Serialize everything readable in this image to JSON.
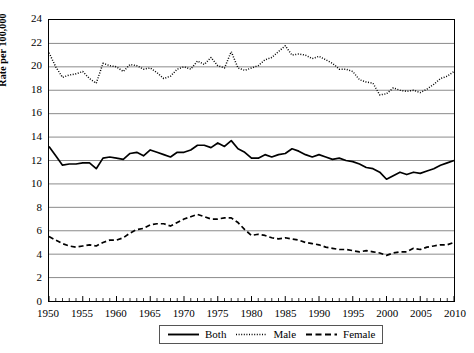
{
  "chart_data": {
    "type": "line",
    "title": "",
    "xlabel": "",
    "ylabel": "Rate per 100,000",
    "xlim": [
      1950,
      2010
    ],
    "ylim": [
      0,
      24
    ],
    "ytick_step": 2,
    "xtick_step": 5,
    "grid": "horizontal",
    "legend_position": "bottom",
    "ytick_labels": [
      "0",
      "2",
      "4",
      "6",
      "8",
      "10",
      "12",
      "14",
      "16",
      "18",
      "20",
      "22",
      "24"
    ],
    "xtick_labels": [
      "1950",
      "1955",
      "1960",
      "1965",
      "1970",
      "1975",
      "1980",
      "1985",
      "1990",
      "1995",
      "2000",
      "2005",
      "2010"
    ],
    "x": [
      1950,
      1951,
      1952,
      1953,
      1954,
      1955,
      1956,
      1957,
      1958,
      1959,
      1960,
      1961,
      1962,
      1963,
      1964,
      1965,
      1966,
      1967,
      1968,
      1969,
      1970,
      1971,
      1972,
      1973,
      1974,
      1975,
      1976,
      1977,
      1978,
      1979,
      1980,
      1981,
      1982,
      1983,
      1984,
      1985,
      1986,
      1987,
      1988,
      1989,
      1990,
      1991,
      1992,
      1993,
      1994,
      1995,
      1996,
      1997,
      1998,
      1999,
      2000,
      2001,
      2002,
      2003,
      2004,
      2005,
      2006,
      2007,
      2008,
      2009,
      2010
    ],
    "series": [
      {
        "name": "Both",
        "style": "solid",
        "color": "#000000",
        "values": [
          13.2,
          12.4,
          11.6,
          11.7,
          11.7,
          11.8,
          11.8,
          11.3,
          12.2,
          12.3,
          12.2,
          12.1,
          12.6,
          12.7,
          12.4,
          12.9,
          12.7,
          12.5,
          12.3,
          12.7,
          12.7,
          12.9,
          13.3,
          13.3,
          13.1,
          13.5,
          13.2,
          13.7,
          13.0,
          12.7,
          12.2,
          12.2,
          12.5,
          12.3,
          12.5,
          12.6,
          13.0,
          12.8,
          12.5,
          12.3,
          12.5,
          12.3,
          12.1,
          12.2,
          12.0,
          11.9,
          11.7,
          11.4,
          11.3,
          11.0,
          10.4,
          10.7,
          11.0,
          10.8,
          11.0,
          10.9,
          11.1,
          11.3,
          11.6,
          11.8,
          12.0
        ],
        "description": "Both sexes combined; starts 13.2 in 1950, dips to 11.3 in 1957, peaks 13.7 in 1977, declines to 10.4 in 2000, rises to 12.0 by 2010"
      },
      {
        "name": "Male",
        "style": "dotted",
        "color": "#000000",
        "values": [
          21.2,
          20.0,
          19.1,
          19.3,
          19.4,
          19.6,
          19.0,
          18.6,
          20.3,
          20.1,
          20.0,
          19.6,
          20.2,
          20.1,
          19.8,
          19.9,
          19.5,
          19.0,
          19.2,
          19.8,
          20.0,
          19.8,
          20.5,
          20.2,
          20.8,
          20.1,
          19.9,
          21.3,
          19.9,
          19.7,
          19.9,
          20.1,
          20.6,
          20.8,
          21.3,
          21.8,
          21.0,
          21.1,
          21.0,
          20.7,
          20.9,
          20.6,
          20.3,
          19.8,
          19.8,
          19.6,
          18.9,
          18.7,
          18.6,
          17.6,
          17.7,
          18.2,
          18.0,
          17.9,
          18.0,
          17.8,
          18.1,
          18.5,
          19.0,
          19.2,
          19.6
        ],
        "description": "Male rates; starts 21.2 in 1950, dips to 18.6 in 1957, peaks 21.8 in 1986, falls to 17.6 in 1999, rises to 19.6 by 2010"
      },
      {
        "name": "Female",
        "style": "dashed",
        "color": "#000000",
        "values": [
          5.5,
          5.2,
          4.9,
          4.7,
          4.6,
          4.7,
          4.8,
          4.7,
          5.0,
          5.2,
          5.2,
          5.4,
          5.8,
          6.1,
          6.2,
          6.5,
          6.6,
          6.6,
          6.4,
          6.7,
          7.0,
          7.2,
          7.4,
          7.2,
          7.0,
          7.0,
          7.1,
          7.1,
          6.7,
          6.1,
          5.6,
          5.7,
          5.6,
          5.4,
          5.3,
          5.4,
          5.3,
          5.2,
          5.0,
          4.9,
          4.8,
          4.6,
          4.5,
          4.4,
          4.4,
          4.3,
          4.2,
          4.3,
          4.2,
          4.1,
          3.9,
          4.1,
          4.2,
          4.2,
          4.5,
          4.4,
          4.6,
          4.7,
          4.8,
          4.8,
          5.0
        ],
        "description": "Female rates; starts 5.5 in 1950, dips 4.6 in 1954, peaks 7.4 in 1972, declines to 3.9 in 2000, rises to 5.0 by 2010"
      }
    ],
    "legend_entries": [
      {
        "label": "Both",
        "style": "solid"
      },
      {
        "label": "Male",
        "style": "dotted"
      },
      {
        "label": "Female",
        "style": "dashed"
      }
    ]
  }
}
